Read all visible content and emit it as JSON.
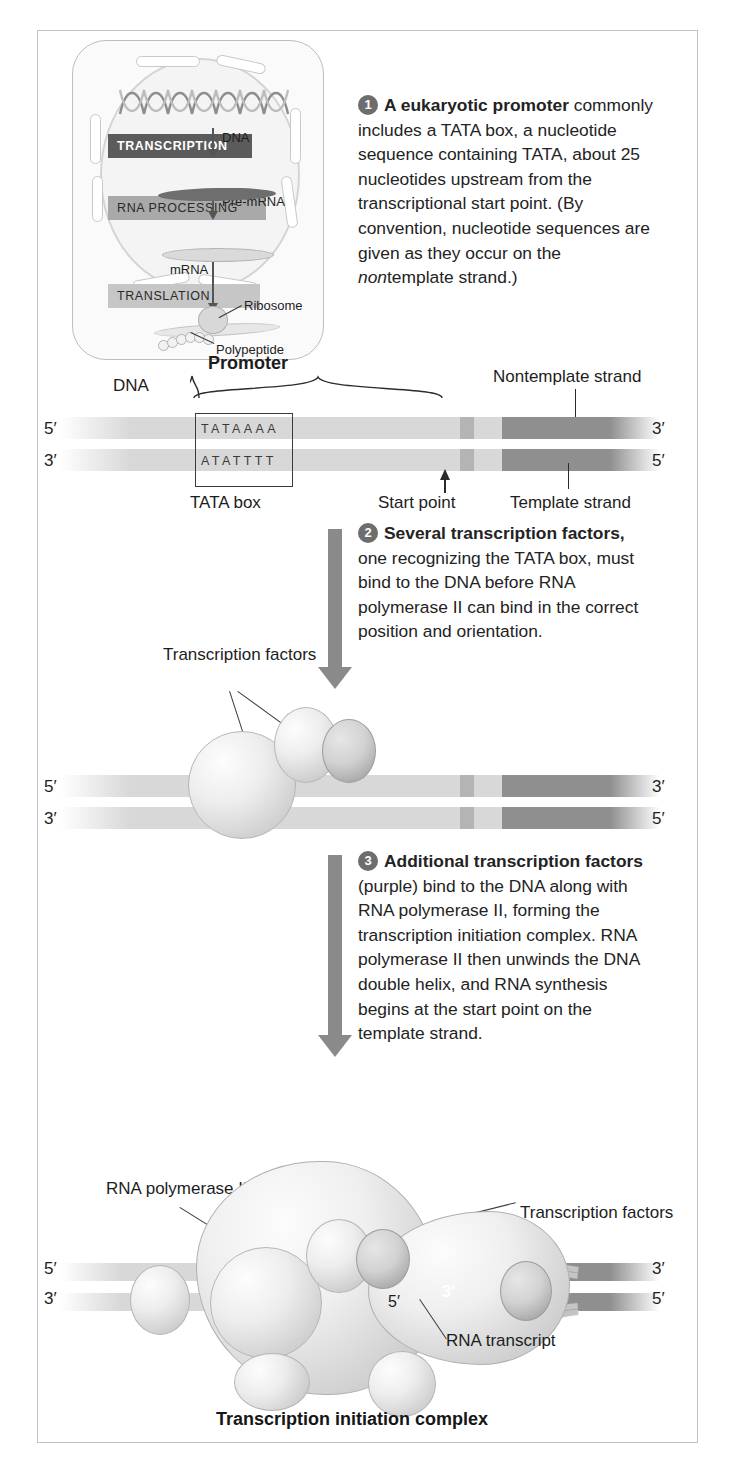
{
  "figure": {
    "caption": "Transcription initiation complex"
  },
  "cell_overview": {
    "stages": [
      {
        "id": "transcription",
        "label": "TRANSCRIPTION"
      },
      {
        "id": "rna_processing",
        "label": "RNA PROCESSING"
      },
      {
        "id": "translation",
        "label": "TRANSLATION"
      }
    ],
    "molecule_labels": [
      {
        "id": "dna",
        "label": "DNA"
      },
      {
        "id": "pre_mrna",
        "label": "Pre-mRNA"
      },
      {
        "id": "mrna",
        "label": "mRNA"
      },
      {
        "id": "ribosome",
        "label": "Ribosome"
      },
      {
        "id": "polypeptide",
        "label": "Polypeptide"
      }
    ]
  },
  "steps": [
    {
      "number": "1",
      "bold": "A eukaryotic promoter",
      "body_before_italic": " commonly includes a TATA box, a nucleotide sequence containing TATA, about 25 nucleotides upstream from the transcriptional start point. (By convention, nucleotide sequences are given as they occur on the ",
      "italic": "non",
      "body_after_italic": "template strand.)"
    },
    {
      "number": "2",
      "bold": "Several transcription factors,",
      "body": " one recognizing the TATA box, must bind to the DNA before RNA polymerase II can bind in the correct position and orientation."
    },
    {
      "number": "3",
      "bold": "Additional transcription factors",
      "body": " (purple) bind to the DNA along with RNA polymerase II, forming the transcription initiation complex. RNA polymerase II then unwinds the DNA double helix, and RNA synthesis begins at the start point on the template strand."
    }
  ],
  "panel1": {
    "dna_label": "DNA",
    "promoter_label": "Promoter",
    "tata_box_label": "TATA box",
    "start_point_label": "Start point",
    "nontemplate_label": "Nontemplate strand",
    "template_label": "Template strand",
    "top_sequence": "TATAAAA",
    "bottom_sequence": "ATATTTT",
    "prime_top_left": "5′",
    "prime_top_right": "3′",
    "prime_bottom_left": "3′",
    "prime_bottom_right": "5′"
  },
  "panel2": {
    "transcription_factors_label": "Transcription factors",
    "prime_top_left": "5′",
    "prime_top_right": "3′",
    "prime_bottom_left": "3′",
    "prime_bottom_right": "5′"
  },
  "panel3": {
    "rna_polymerase_label": "RNA polymerase II",
    "transcription_factors_label": "Transcription factors",
    "rna_transcript_label": "RNA transcript",
    "transcript_five_prime": "5′",
    "transcript_three_prime": "3′",
    "prime_top_left": "5′",
    "prime_top_right": "3′",
    "prime_bottom_left": "3′",
    "prime_bottom_right": "5′"
  },
  "colors": {
    "dna_light": "#d8d8d8",
    "dna_mid": "#b4b4b4",
    "dna_dark": "#8f8f8f",
    "arrow_gray": "#8a8a8a",
    "badge_gray": "#6d6d6d",
    "bar_dark": "#5b5b5b",
    "text": "#232323"
  }
}
